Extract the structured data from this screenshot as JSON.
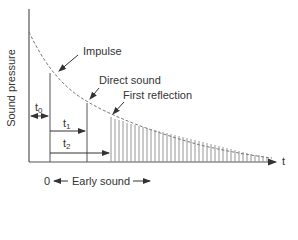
{
  "diagram": {
    "y_axis_label": "Sound pressure",
    "x_axis_label": "t",
    "annotations": {
      "impulse": "Impulse",
      "direct_sound": "Direct sound",
      "first_reflection": "First reflection"
    },
    "intervals": {
      "t0": {
        "base": "t",
        "sub": "0"
      },
      "t1": {
        "base": "t",
        "sub": "1"
      },
      "t2": {
        "base": "t",
        "sub": "2"
      }
    },
    "bottom": {
      "origin": "0",
      "early_sound": "Early sound"
    },
    "colors": {
      "line": "#555555",
      "bars": "#888888",
      "curve": "#777777"
    }
  }
}
